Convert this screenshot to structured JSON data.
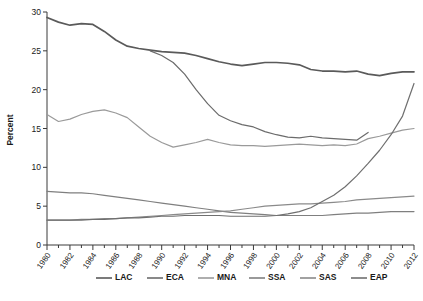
{
  "chart_data": {
    "type": "line",
    "title": "",
    "subtitle": "",
    "xlabel": "",
    "ylabel": "Percent",
    "xlim": [
      1980,
      2012
    ],
    "ylim": [
      0,
      30
    ],
    "yticks": [
      0,
      5,
      10,
      15,
      20,
      25,
      30
    ],
    "xticks": [
      1980,
      1982,
      1984,
      1986,
      1988,
      1990,
      1992,
      1994,
      1996,
      1998,
      2000,
      2002,
      2004,
      2006,
      2008,
      2010,
      2012
    ],
    "x": [
      1980,
      1981,
      1982,
      1983,
      1984,
      1985,
      1986,
      1987,
      1988,
      1989,
      1990,
      1991,
      1992,
      1993,
      1994,
      1995,
      1996,
      1997,
      1998,
      1999,
      2000,
      2001,
      2002,
      2003,
      2004,
      2005,
      2006,
      2007,
      2008,
      2009,
      2010,
      2011,
      2012
    ],
    "grid": false,
    "legend_position": "bottom",
    "series": [
      {
        "name": "LAC",
        "color": "#5a5a5a",
        "values": [
          29.3,
          28.7,
          28.3,
          28.5,
          28.4,
          27.5,
          26.4,
          25.6,
          25.3,
          25.1,
          24.9,
          24.8,
          24.7,
          24.4,
          24.0,
          23.6,
          23.3,
          23.1,
          23.3,
          23.5,
          23.5,
          23.4,
          23.2,
          22.6,
          22.4,
          22.4,
          22.3,
          22.4,
          22.0,
          21.8,
          22.1,
          22.3,
          22.3
        ]
      },
      {
        "name": "ECA",
        "color": "#6b6b6b",
        "values": [
          null,
          null,
          null,
          null,
          null,
          null,
          null,
          null,
          null,
          25.0,
          24.4,
          23.5,
          22.0,
          20.0,
          18.2,
          16.7,
          16.0,
          15.5,
          15.2,
          14.6,
          14.2,
          13.9,
          13.8,
          14.0,
          13.8,
          13.7,
          13.6,
          13.5,
          14.5,
          null,
          null,
          null,
          null
        ]
      },
      {
        "name": "MNA",
        "color": "#9a9a9a",
        "values": [
          16.8,
          15.9,
          16.2,
          16.8,
          17.2,
          17.4,
          17.0,
          16.4,
          15.2,
          14.0,
          13.2,
          12.6,
          12.9,
          13.2,
          13.6,
          13.2,
          12.9,
          12.8,
          12.8,
          12.7,
          12.8,
          12.9,
          13.0,
          12.9,
          12.8,
          12.9,
          12.8,
          13.0,
          13.7,
          14.0,
          14.4,
          14.8,
          15.0
        ]
      },
      {
        "name": "SSA",
        "color": "#7f7f7f",
        "values": [
          6.9,
          6.8,
          6.7,
          6.7,
          6.6,
          6.4,
          6.2,
          6.0,
          5.8,
          5.6,
          5.4,
          5.2,
          5.0,
          4.8,
          4.6,
          4.4,
          4.2,
          4.1,
          4.0,
          3.9,
          3.8,
          3.8,
          3.8,
          3.8,
          3.8,
          3.9,
          4.0,
          4.1,
          4.1,
          4.2,
          4.3,
          4.3,
          4.3
        ]
      },
      {
        "name": "SAS",
        "color": "#8a8a8a",
        "values": [
          3.2,
          3.2,
          3.2,
          3.3,
          3.3,
          3.4,
          3.4,
          3.5,
          3.6,
          3.7,
          3.8,
          3.9,
          4.0,
          4.1,
          4.2,
          4.3,
          4.4,
          4.6,
          4.8,
          5.0,
          5.1,
          5.2,
          5.3,
          5.3,
          5.4,
          5.5,
          5.6,
          5.8,
          5.9,
          6.0,
          6.1,
          6.2,
          6.3
        ]
      },
      {
        "name": "EAP",
        "color": "#6f6f6f",
        "values": [
          3.2,
          3.2,
          3.2,
          3.2,
          3.3,
          3.3,
          3.4,
          3.5,
          3.5,
          3.6,
          3.7,
          3.7,
          3.8,
          3.8,
          3.8,
          3.8,
          3.7,
          3.7,
          3.7,
          3.7,
          3.8,
          4.0,
          4.3,
          4.8,
          5.6,
          6.4,
          7.5,
          8.9,
          10.5,
          12.2,
          14.2,
          16.6,
          20.8
        ]
      }
    ]
  },
  "legend": {
    "items": [
      {
        "label": "LAC"
      },
      {
        "label": "ECA"
      },
      {
        "label": "MNA"
      },
      {
        "label": "SSA"
      },
      {
        "label": "SAS"
      },
      {
        "label": "EAP"
      }
    ]
  },
  "caption": {
    "text": ""
  }
}
